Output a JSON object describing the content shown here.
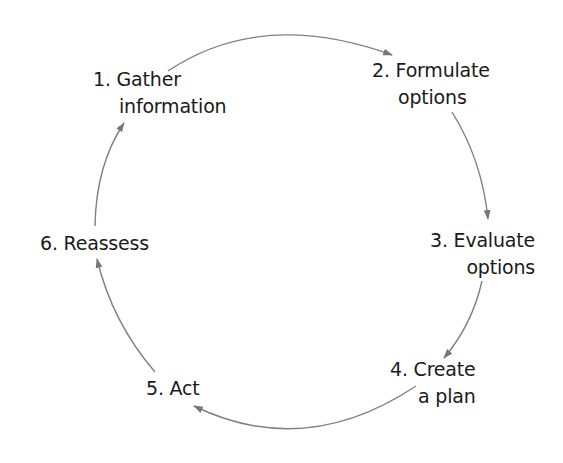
{
  "diagram": {
    "type": "cycle",
    "arrow_color": "#777777",
    "text_color": "#1a1a1a",
    "steps": [
      {
        "number": "1.",
        "line1": "Gather",
        "line2": "information"
      },
      {
        "number": "2.",
        "line1": "Formulate",
        "line2": "options"
      },
      {
        "number": "3.",
        "line1": "Evaluate",
        "line2": "options"
      },
      {
        "number": "4.",
        "line1": "Create",
        "line2": "a plan"
      },
      {
        "number": "5.",
        "line1": "Act",
        "line2": ""
      },
      {
        "number": "6.",
        "line1": "Reassess",
        "line2": ""
      }
    ],
    "edges": [
      {
        "from": 1,
        "to": 2
      },
      {
        "from": 2,
        "to": 3
      },
      {
        "from": 3,
        "to": 4
      },
      {
        "from": 4,
        "to": 5
      },
      {
        "from": 5,
        "to": 6
      },
      {
        "from": 6,
        "to": 1
      }
    ]
  }
}
